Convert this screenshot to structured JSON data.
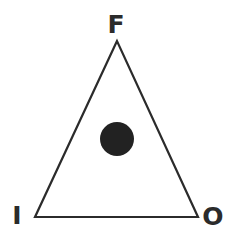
{
  "diagram": {
    "shape": "triangle",
    "stroke_color": "#2b2b2b",
    "fill_color": "#ffffff",
    "dot_color": "#222222",
    "vertices": {
      "top": {
        "label": "F"
      },
      "bottom_left": {
        "label": "I"
      },
      "bottom_right": {
        "label": "O"
      }
    },
    "marker": {
      "type": "filled-circle",
      "position": "center"
    }
  }
}
